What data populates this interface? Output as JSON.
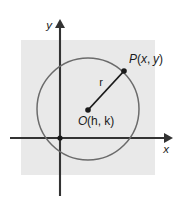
{
  "figure": {
    "type": "geometry-diagram"
  },
  "axes": {
    "y_label": "y",
    "x_label": "x",
    "origin_label": "",
    "y_axis_name": "y-axis",
    "x_axis_name": "x-axis"
  },
  "labels": {
    "point_p_italic": "P",
    "point_p_paren": "(",
    "point_p_x": "x",
    "point_p_comma": ", ",
    "point_p_y": "y",
    "point_p_close": ")",
    "point_p_full": "P(x, y)",
    "center_italic": "O",
    "center_rest": "(h, k)",
    "center_full": "O(h, k)",
    "radius": "r"
  },
  "colors": {
    "background": "#ffffff",
    "panel_gray": "#e9e9e9",
    "circle_stroke": "#6b6b6b",
    "axis_stroke": "#333333",
    "radius_stroke": "#1a1a1a",
    "point_fill": "#1a1a1a",
    "text": "#1a1a1a"
  },
  "geometry": {
    "panel": {
      "x": 21,
      "y": 40,
      "width": 134,
      "height": 135
    },
    "circle": {
      "cx": 88,
      "cy": 109,
      "r": 51
    },
    "origin": {
      "x": 60,
      "y": 138
    },
    "center_point": {
      "x": 88,
      "y": 110
    },
    "point_p": {
      "x": 124,
      "y": 71
    },
    "y_axis": {
      "x": 60,
      "y_top": 22,
      "y_bottom": 196
    },
    "x_axis": {
      "y": 138,
      "x_left": 10,
      "x_right": 168
    }
  }
}
